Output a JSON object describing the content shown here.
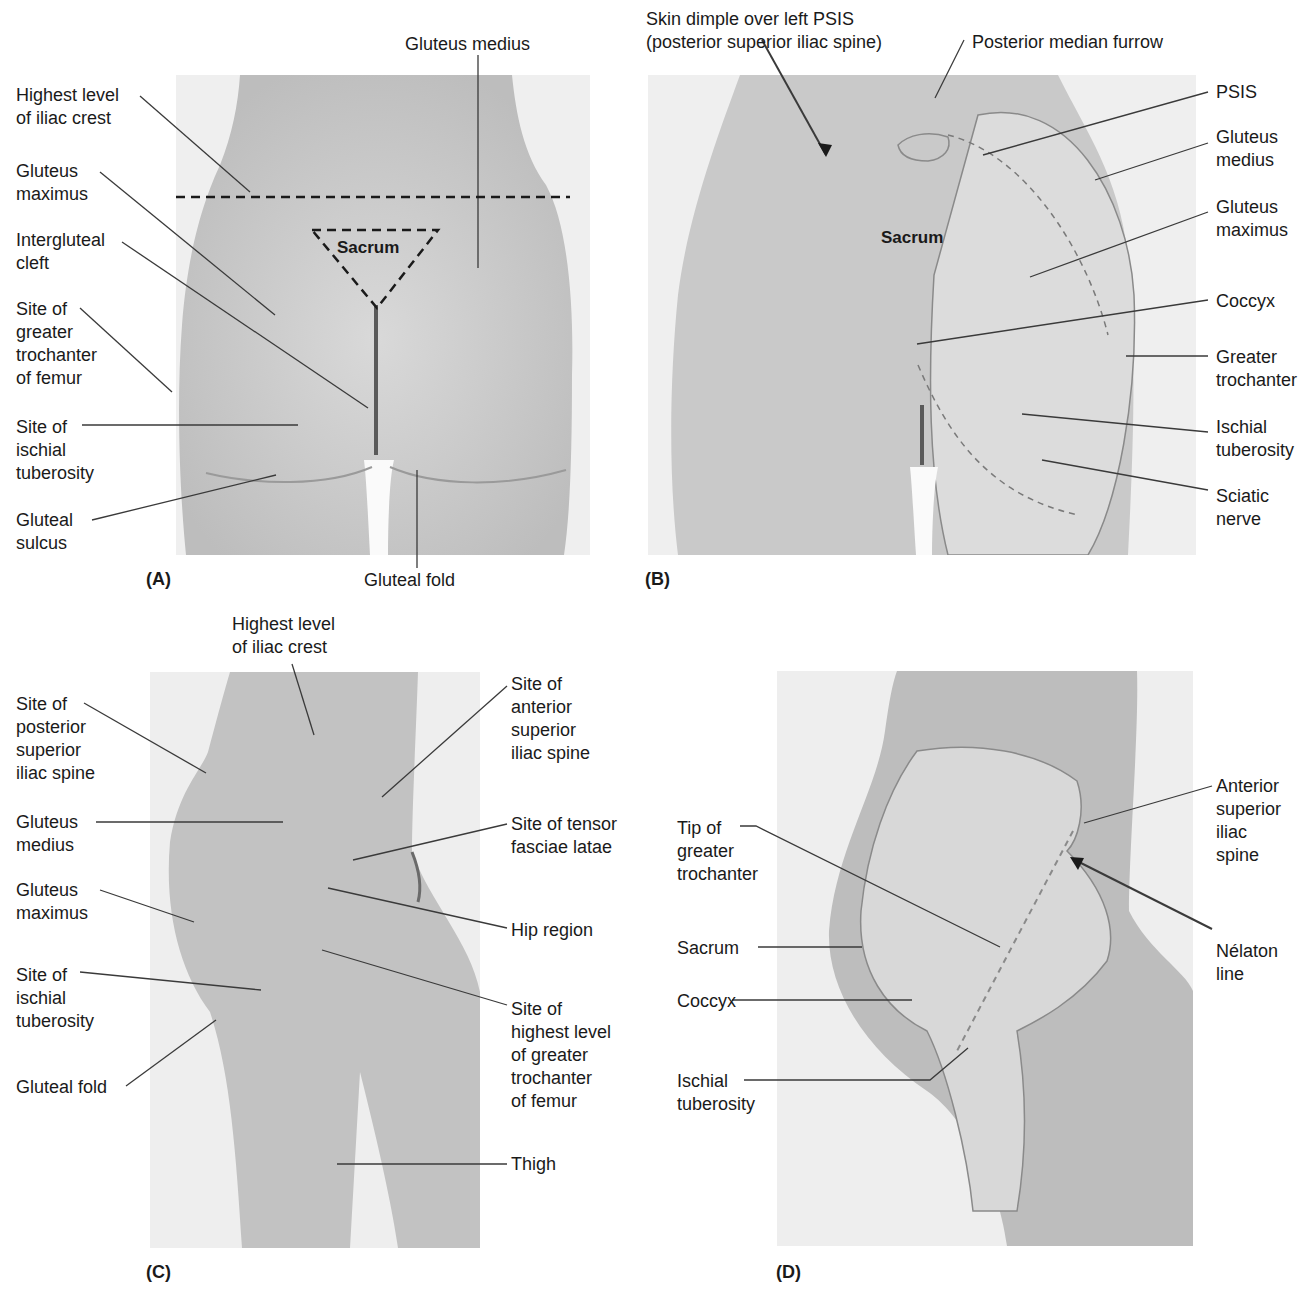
{
  "figure": {
    "panels": [
      {
        "id": "A",
        "label": "(A)",
        "inner_label": "Sacrum",
        "labels": {
          "gluteus_medius": "Gluteus medius",
          "highest_iliac_crest": "Highest level\nof iliac crest",
          "gluteus_maximus": "Gluteus\nmaximus",
          "intergluteal_cleft": "Intergluteal\ncleft",
          "greater_trochanter": "Site of\ngreater\ntrochanter\nof femur",
          "ischial_tuberosity": "Site of\nischial\ntuberosity",
          "gluteal_sulcus": "Gluteal\nsulcus",
          "gluteal_fold": "Gluteal fold"
        }
      },
      {
        "id": "B",
        "label": "(B)",
        "inner_label": "Sacrum",
        "labels": {
          "skin_dimple": "Skin dimple over left PSIS\n(posterior superior iliac spine)",
          "posterior_median_furrow": "Posterior median furrow",
          "psis": "PSIS",
          "gluteus_medius": "Gluteus\nmedius",
          "gluteus_maximus": "Gluteus\nmaximus",
          "coccyx": "Coccyx",
          "greater_trochanter": "Greater\ntrochanter",
          "ischial_tuberosity": "Ischial\ntuberosity",
          "sciatic_nerve": "Sciatic\nnerve"
        }
      },
      {
        "id": "C",
        "label": "(C)",
        "labels": {
          "highest_iliac_crest": "Highest level\nof iliac crest",
          "psis_site": "Site of\nposterior\nsuperior\niliac spine",
          "gluteus_medius": "Gluteus\nmedius",
          "gluteus_maximus": "Gluteus\nmaximus",
          "ischial_tuberosity": "Site of\nischial\ntuberosity",
          "gluteal_fold": "Gluteal fold",
          "asis_site": "Site of\nanterior\nsuperior\niliac spine",
          "tensor_fasciae_latae": "Site of tensor\nfasciae latae",
          "hip_region": "Hip region",
          "greater_trochanter_site": "Site of\nhighest level\nof greater\ntrochanter\nof femur",
          "thigh": "Thigh"
        }
      },
      {
        "id": "D",
        "label": "(D)",
        "labels": {
          "tip_greater_trochanter": "Tip of\ngreater\ntrochanter",
          "sacrum": "Sacrum",
          "coccyx": "Coccyx",
          "ischial_tuberosity": "Ischial\ntuberosity",
          "asis": "Anterior\nsuperior\niliac\nspine",
          "nelaton_line": "Nélaton\nline"
        }
      }
    ]
  }
}
